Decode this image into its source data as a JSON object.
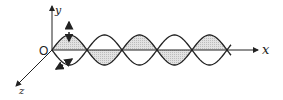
{
  "diagram": {
    "labels": {
      "origin": "O",
      "x_axis": "x",
      "y_axis": "y",
      "z_axis": "z"
    },
    "geometry": {
      "origin": [
        52,
        50
      ],
      "half_wavelength_px": 35,
      "amplitude_px": 15,
      "node_count": 6,
      "x_axis_end": 258
    },
    "colors": {
      "stroke": "#222222",
      "fill_shade": "#d4d4d4",
      "background": "#ffffff"
    },
    "annotations": {
      "y_oscillation_arrow": "double-headed arrow along y at first crest",
      "z_oscillation_arrow": "double-headed arrow along z at first trough"
    }
  }
}
